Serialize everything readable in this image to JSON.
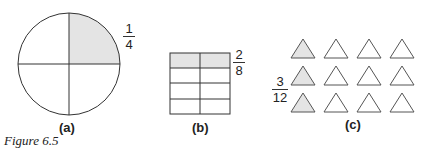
{
  "figure": {
    "caption": "Figure 6.5",
    "panels": [
      {
        "label": "(a)",
        "shape": "circle",
        "parts": 4,
        "shaded": 1,
        "fraction": {
          "numerator": "1",
          "denominator": "4"
        }
      },
      {
        "label": "(b)",
        "shape": "rectangle-grid",
        "rows": 4,
        "cols": 2,
        "parts": 8,
        "shaded": 2,
        "fraction": {
          "numerator": "2",
          "denominator": "8"
        }
      },
      {
        "label": "(c)",
        "shape": "triangle-array",
        "rows": 3,
        "cols": 4,
        "parts": 12,
        "shaded": 3,
        "fraction": {
          "numerator": "3",
          "denominator": "12"
        }
      }
    ],
    "colors": {
      "shade": "#e4e4e4",
      "stroke": "#333333"
    }
  }
}
